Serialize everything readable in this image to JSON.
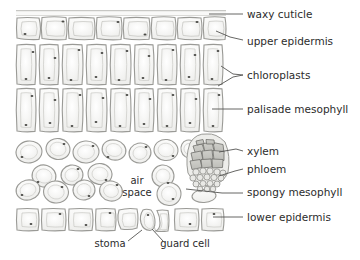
{
  "figure": {
    "type": "biological-diagram",
    "background_color": "#ffffff",
    "line_color": "#8c8c8c",
    "label_color": "#2c2c2c",
    "cell_fill": "#f2f2f0",
    "cell_wall": "#9a9a96",
    "chloroplast_color": "#4a4a46",
    "xylem_fill": "#c9c9c4",
    "phloem_fill": "#e2e2de"
  },
  "labels": [
    {
      "id": "waxy-cuticle",
      "text": "waxy cuticle",
      "x": 247,
      "y": 18,
      "leader": "straight"
    },
    {
      "id": "upper-epidermis",
      "text": "upper epidermis",
      "x": 247,
      "y": 45,
      "leader": "angled"
    },
    {
      "id": "chloroplasts",
      "text": "chloroplasts",
      "x": 247,
      "y": 79,
      "leader": "fork"
    },
    {
      "id": "palisade-mesophyll",
      "text": "palisade mesophyll",
      "x": 247,
      "y": 113,
      "leader": "straight"
    },
    {
      "id": "xylem",
      "text": "xylem",
      "x": 247,
      "y": 155,
      "leader": "angled"
    },
    {
      "id": "phloem",
      "text": "phloem",
      "x": 247,
      "y": 173,
      "leader": "angled"
    },
    {
      "id": "spongy-mesophyll",
      "text": "spongy mesophyll",
      "x": 247,
      "y": 196,
      "leader": "straight"
    },
    {
      "id": "lower-epidermis",
      "text": "lower epidermis",
      "x": 247,
      "y": 221,
      "leader": "straight"
    }
  ],
  "inner_labels": [
    {
      "id": "air-space-line1",
      "text": "air",
      "x": 137,
      "y": 184,
      "anchor": "middle"
    },
    {
      "id": "air-space-line2",
      "text": "space",
      "x": 137,
      "y": 196,
      "anchor": "middle"
    },
    {
      "id": "stoma",
      "text": "stoma",
      "x": 110,
      "y": 247,
      "anchor": "middle"
    },
    {
      "id": "guard-cell",
      "text": "guard cell",
      "x": 185,
      "y": 247,
      "anchor": "middle"
    }
  ],
  "tissue_layers": [
    {
      "id": "cuticle",
      "name": "waxy cuticle",
      "y_top": 10,
      "y_bottom": 16,
      "cell_count": 0
    },
    {
      "id": "upper-epidermis",
      "name": "upper epidermis",
      "y_top": 16,
      "y_bottom": 42,
      "cell_count": 8
    },
    {
      "id": "palisade-row-1",
      "name": "palisade mesophyll",
      "y_top": 44,
      "y_bottom": 86,
      "cell_count": 9
    },
    {
      "id": "palisade-row-2",
      "name": "palisade mesophyll",
      "y_top": 88,
      "y_bottom": 134,
      "cell_count": 9
    },
    {
      "id": "spongy-mesophyll",
      "name": "spongy mesophyll",
      "y_top": 136,
      "y_bottom": 204,
      "cell_count": 28
    },
    {
      "id": "lower-epidermis",
      "name": "lower epidermis",
      "y_top": 206,
      "y_bottom": 232,
      "cell_count": 7
    }
  ],
  "vascular_bundle": {
    "id": "vascular-bundle",
    "x": 188,
    "y": 140,
    "width": 46,
    "height": 60,
    "xylem_cells": 11,
    "phloem_cells": 17
  },
  "stoma": {
    "id": "stoma-opening",
    "x": 152,
    "y": 226,
    "guard_cell_count": 2
  }
}
